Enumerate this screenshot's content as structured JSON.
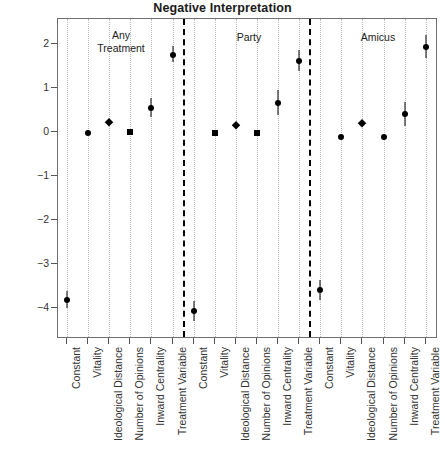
{
  "chart_data": {
    "type": "scatter",
    "title": "Negative Interpretation",
    "xlabel": "",
    "ylabel": "Parameter Estimate",
    "ylim": [
      -4.55,
      2.7
    ],
    "yticks": [
      2,
      1,
      0,
      -1,
      -2,
      -3,
      -4
    ],
    "ytick_labels": [
      "2",
      "1",
      "0",
      "-1",
      "-2",
      "-3",
      "-4"
    ],
    "grid": "vertical-dotted",
    "legend": "none",
    "panels": [
      {
        "name": "Any Treatment",
        "label": "Any\nTreatment",
        "points": [
          {
            "term": "Constant",
            "estimate": -3.82,
            "low": -4.0,
            "high": -3.62,
            "marker": "circle"
          },
          {
            "term": "Vitality",
            "estimate": -0.03,
            "low": -0.06,
            "high": 0.0,
            "marker": "circle"
          },
          {
            "term": "Ideological Distance",
            "estimate": 0.22,
            "low": 0.16,
            "high": 0.28,
            "marker": "diamond"
          },
          {
            "term": "Number of Opinions",
            "estimate": 0.0,
            "low": -0.03,
            "high": 0.03,
            "marker": "square"
          },
          {
            "term": "Inward Centrality",
            "estimate": 0.55,
            "low": 0.35,
            "high": 0.78,
            "marker": "circle"
          },
          {
            "term": "Treatment Variable",
            "estimate": 1.76,
            "low": 1.6,
            "high": 1.95,
            "marker": "circle"
          }
        ]
      },
      {
        "name": "Party",
        "label": "Party",
        "points": [
          {
            "term": "Constant",
            "estimate": -4.06,
            "low": -4.3,
            "high": -3.85,
            "marker": "circle"
          },
          {
            "term": "Vitality",
            "estimate": -0.03,
            "low": -0.06,
            "high": 0.0,
            "marker": "square"
          },
          {
            "term": "Ideological Distance",
            "estimate": 0.16,
            "low": 0.1,
            "high": 0.22,
            "marker": "diamond"
          },
          {
            "term": "Number of Opinions",
            "estimate": -0.02,
            "low": -0.05,
            "high": 0.01,
            "marker": "square"
          },
          {
            "term": "Inward Centrality",
            "estimate": 0.65,
            "low": 0.38,
            "high": 0.95,
            "marker": "circle"
          },
          {
            "term": "Treatment Variable",
            "estimate": 1.62,
            "low": 1.38,
            "high": 1.87,
            "marker": "circle"
          }
        ]
      },
      {
        "name": "Amicus",
        "label": "Amicus",
        "points": [
          {
            "term": "Constant",
            "estimate": -3.58,
            "low": -3.82,
            "high": -3.36,
            "marker": "circle"
          },
          {
            "term": "Vitality",
            "estimate": -0.12,
            "low": -0.15,
            "high": -0.09,
            "marker": "circle"
          },
          {
            "term": "Ideological Distance",
            "estimate": 0.2,
            "low": 0.14,
            "high": 0.26,
            "marker": "diamond"
          },
          {
            "term": "Number of Opinions",
            "estimate": -0.12,
            "low": -0.15,
            "high": -0.09,
            "marker": "circle"
          },
          {
            "term": "Inward Centrality",
            "estimate": 0.4,
            "low": 0.13,
            "high": 0.68,
            "marker": "circle"
          },
          {
            "term": "Treatment Variable",
            "estimate": 1.93,
            "low": 1.68,
            "high": 2.2,
            "marker": "circle"
          }
        ]
      }
    ],
    "colors": {
      "marker": "#000000",
      "axis": "#555555",
      "grid": "#b9b9b9",
      "divider": "#000000",
      "text": "#222222"
    }
  }
}
